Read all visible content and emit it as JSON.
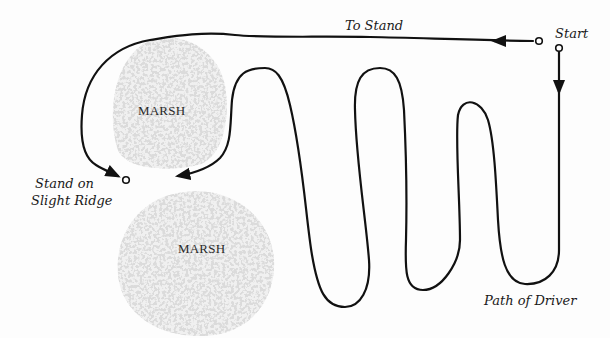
{
  "diagram": {
    "type": "hunting drive path map",
    "colors": {
      "background": "#fdfdfd",
      "path": "#111111",
      "marsh": "#bcbcbc",
      "text": "#1a1a1a"
    },
    "labels": {
      "start": "Start",
      "to_stand": "To Stand",
      "stand": "Stand on",
      "stand_line2": "Slight Ridge",
      "path_of_driver": "Path of Driver"
    },
    "areas": [
      {
        "id": "marsh-upper",
        "label": "MARSH"
      },
      {
        "id": "marsh-lower",
        "label": "MARSH"
      }
    ],
    "markers": [
      {
        "id": "start-point-top",
        "shape": "open-circle"
      },
      {
        "id": "start-point-right",
        "shape": "open-circle"
      },
      {
        "id": "stand-point",
        "shape": "open-circle"
      }
    ],
    "arrows": [
      {
        "id": "to-stand-arrow",
        "direction": "left"
      },
      {
        "id": "driver-start-arrow",
        "direction": "down"
      },
      {
        "id": "route-arrow-left",
        "direction": "down-right"
      },
      {
        "id": "driver-end-arrow",
        "direction": "down-left"
      }
    ]
  }
}
